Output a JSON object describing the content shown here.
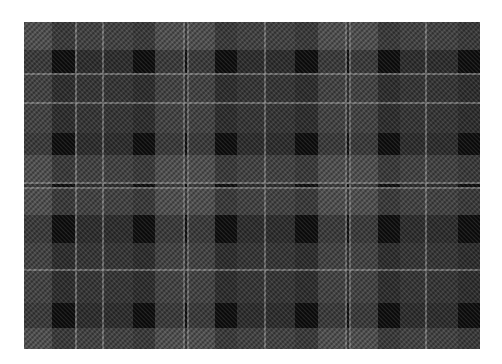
{
  "image": {
    "subject": "Grayscale tartan / plaid fabric swatch",
    "background": "#ffffff"
  },
  "fabric": {
    "x": 24,
    "y": 22,
    "width": 456,
    "height": 327,
    "colors": {
      "black": "#080808",
      "dark": "#262626",
      "mid_dark": "#383838",
      "mid": "#555555",
      "light_line": "#8a8a8a"
    },
    "vertical_bands": [
      {
        "x": 0,
        "w": 28,
        "tone": "mid"
      },
      {
        "x": 28,
        "w": 23,
        "tone": "dark"
      },
      {
        "x": 51,
        "w": 2,
        "tone": "light_line"
      },
      {
        "x": 53,
        "w": 25,
        "tone": "mid_dark"
      },
      {
        "x": 78,
        "w": 2,
        "tone": "light_line"
      },
      {
        "x": 80,
        "w": 29,
        "tone": "mid_dark"
      },
      {
        "x": 109,
        "w": 22,
        "tone": "dark"
      },
      {
        "x": 131,
        "w": 28,
        "tone": "mid"
      },
      {
        "x": 159,
        "w": 2,
        "tone": "light_line"
      },
      {
        "x": 161,
        "w": 2,
        "tone": "dark"
      },
      {
        "x": 163,
        "w": 2,
        "tone": "light_line"
      },
      {
        "x": 165,
        "w": 26,
        "tone": "mid"
      },
      {
        "x": 191,
        "w": 22,
        "tone": "dark"
      },
      {
        "x": 213,
        "w": 27,
        "tone": "mid_dark"
      },
      {
        "x": 240,
        "w": 2,
        "tone": "light_line"
      },
      {
        "x": 242,
        "w": 29,
        "tone": "mid_dark"
      },
      {
        "x": 271,
        "w": 23,
        "tone": "dark"
      },
      {
        "x": 294,
        "w": 27,
        "tone": "mid"
      },
      {
        "x": 321,
        "w": 2,
        "tone": "light_line"
      },
      {
        "x": 323,
        "w": 2,
        "tone": "dark"
      },
      {
        "x": 325,
        "w": 2,
        "tone": "light_line"
      },
      {
        "x": 327,
        "w": 27,
        "tone": "mid"
      },
      {
        "x": 354,
        "w": 22,
        "tone": "dark"
      },
      {
        "x": 376,
        "w": 25,
        "tone": "mid_dark"
      },
      {
        "x": 401,
        "w": 2,
        "tone": "light_line"
      },
      {
        "x": 403,
        "w": 31,
        "tone": "mid_dark"
      },
      {
        "x": 434,
        "w": 22,
        "tone": "dark"
      }
    ],
    "horizontal_bands": [
      {
        "y": 0,
        "h": 28,
        "tone": "mid"
      },
      {
        "y": 28,
        "h": 23,
        "tone": "dark"
      },
      {
        "y": 51,
        "h": 2,
        "tone": "light_line"
      },
      {
        "y": 53,
        "h": 27,
        "tone": "mid_dark"
      },
      {
        "y": 80,
        "h": 2,
        "tone": "light_line"
      },
      {
        "y": 82,
        "h": 29,
        "tone": "mid_dark"
      },
      {
        "y": 111,
        "h": 22,
        "tone": "dark"
      },
      {
        "y": 133,
        "h": 27,
        "tone": "mid"
      },
      {
        "y": 160,
        "h": 2,
        "tone": "light_line"
      },
      {
        "y": 162,
        "h": 3,
        "tone": "dark"
      },
      {
        "y": 165,
        "h": 2,
        "tone": "light_line"
      },
      {
        "y": 167,
        "h": 26,
        "tone": "mid"
      },
      {
        "y": 193,
        "h": 28,
        "tone": "dark"
      },
      {
        "y": 221,
        "h": 26,
        "tone": "mid_dark"
      },
      {
        "y": 247,
        "h": 2,
        "tone": "light_line"
      },
      {
        "y": 249,
        "h": 32,
        "tone": "mid_dark"
      },
      {
        "y": 281,
        "h": 25,
        "tone": "dark"
      },
      {
        "y": 306,
        "h": 21,
        "tone": "mid"
      }
    ]
  }
}
